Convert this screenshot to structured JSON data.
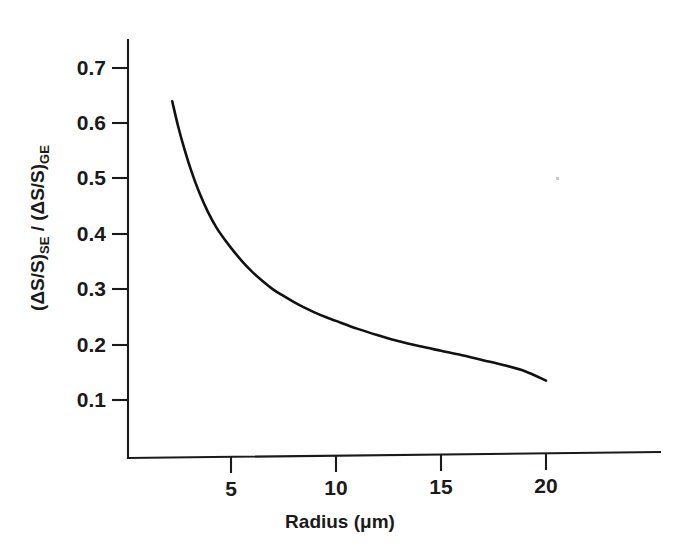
{
  "chart_data": {
    "type": "line",
    "title": "",
    "subtitle": "",
    "xlabel": "Radius (μm)",
    "ylabel": "(ΔS/S)SE / (ΔS/S)GE",
    "ylabel_parts": {
      "numerator_base": "(ΔS/S)",
      "numerator_sub": "SE",
      "separator": " / ",
      "denominator_base": "(ΔS/S)",
      "denominator_sub": "GE"
    },
    "xlim": [
      0,
      24
    ],
    "ylim": [
      0,
      0.76
    ],
    "grid": false,
    "legend": null,
    "xticks": [
      5,
      10,
      15,
      20
    ],
    "xtick_labels": [
      "5",
      "10",
      "15",
      "20"
    ],
    "yticks": [
      0.1,
      0.2,
      0.3,
      0.4,
      0.5,
      0.6,
      0.7
    ],
    "ytick_labels": [
      "0.1",
      "0.2",
      "0.3",
      "0.4",
      "0.5",
      "0.6",
      "0.7"
    ],
    "series": [
      {
        "name": "SE/GE signal ratio",
        "color": "#111111",
        "x": [
          2.2,
          2.5,
          2.8,
          3.1,
          3.5,
          3.9,
          4.3,
          4.7,
          5.0,
          5.5,
          6.0,
          6.5,
          7.0,
          7.5,
          8.0,
          8.5,
          9.0,
          9.5,
          10.0,
          11.0,
          12.0,
          13.0,
          14.0,
          15.0,
          16.0,
          17.0,
          18.0,
          19.0,
          20.0
        ],
        "y": [
          0.64,
          0.592,
          0.551,
          0.515,
          0.474,
          0.44,
          0.412,
          0.39,
          0.375,
          0.352,
          0.332,
          0.315,
          0.3,
          0.288,
          0.277,
          0.267,
          0.258,
          0.25,
          0.243,
          0.229,
          0.217,
          0.206,
          0.197,
          0.189,
          0.181,
          0.172,
          0.163,
          0.152,
          0.135
        ]
      }
    ],
    "annotations": []
  },
  "axes": {
    "y_axis_name": "y-axis",
    "x_axis_name": "x-axis"
  }
}
